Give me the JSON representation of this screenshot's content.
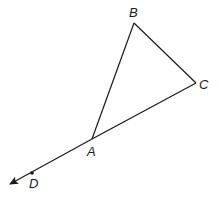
{
  "diagram": {
    "type": "geometry",
    "stroke_color": "#1a1a1a",
    "points": [
      {
        "label": "A",
        "x": 92,
        "y": 139
      },
      {
        "label": "B",
        "x": 134,
        "y": 23
      },
      {
        "label": "C",
        "x": 196,
        "y": 83
      },
      {
        "label": "D",
        "x": 32,
        "y": 173
      }
    ],
    "segments": [
      {
        "from": "A",
        "to": "B"
      },
      {
        "from": "B",
        "to": "C"
      },
      {
        "from": "C",
        "to": "A"
      }
    ],
    "rays": [
      {
        "from": "A",
        "through": "D",
        "arrow": true
      }
    ],
    "labels": {
      "A": "A",
      "B": "B",
      "C": "C",
      "D": "D"
    }
  }
}
